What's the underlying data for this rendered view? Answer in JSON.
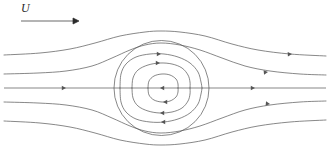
{
  "figure": {
    "background_color": "#ffffff",
    "stroke_color": "#555555",
    "label_color": "#2a2a2a",
    "width": 330,
    "height": 165
  },
  "annotations": {
    "freestream_label": "U",
    "freestream_arrow": {
      "name": "freestream-velocity-arrow",
      "x1": 21,
      "y1": 21,
      "x2": 79,
      "y2": 21,
      "direction": "right"
    }
  },
  "chart_data": {
    "type": "line",
    "subtitle": "Uniform stream U past a spherical vortex",
    "xlabel": "",
    "ylabel": "",
    "xlim": [
      0,
      330
    ],
    "ylim": [
      0,
      165
    ],
    "grid": false,
    "legend": "none",
    "symmetry_axis": {
      "name": "centerline",
      "y": 88,
      "x_start": 4,
      "x_end": 326
    },
    "vortex_boundary": {
      "name": "vortex-sphere-boundary",
      "shape": "circle",
      "cx": 161.5,
      "cy": 88,
      "r": 47.5
    },
    "series": [
      {
        "name": "outer-streamline-top",
        "kind": "external",
        "points": [
          [
            4,
            55
          ],
          [
            40,
            53
          ],
          [
            70,
            49
          ],
          [
            95,
            43
          ],
          [
            120,
            36
          ],
          [
            145,
            32
          ],
          [
            161,
            31
          ],
          [
            180,
            32
          ],
          [
            205,
            36
          ],
          [
            232,
            44
          ],
          [
            258,
            50
          ],
          [
            290,
            54
          ],
          [
            326,
            56
          ]
        ]
      },
      {
        "name": "streamline-top-inner",
        "kind": "external",
        "points": [
          [
            4,
            74
          ],
          [
            38,
            73
          ],
          [
            66,
            71
          ],
          [
            92,
            66
          ],
          [
            112,
            58
          ],
          [
            130,
            50
          ],
          [
            145,
            45
          ],
          [
            161,
            43
          ],
          [
            180,
            45
          ],
          [
            200,
            50
          ],
          [
            222,
            58
          ],
          [
            245,
            66
          ],
          [
            270,
            71
          ],
          [
            300,
            74
          ],
          [
            326,
            75
          ]
        ]
      },
      {
        "name": "streamline-bottom-inner",
        "kind": "external",
        "points": [
          [
            4,
            102
          ],
          [
            38,
            103
          ],
          [
            66,
            105
          ],
          [
            92,
            110
          ],
          [
            112,
            118
          ],
          [
            130,
            126
          ],
          [
            145,
            131
          ],
          [
            161,
            133
          ],
          [
            180,
            131
          ],
          [
            200,
            126
          ],
          [
            222,
            118
          ],
          [
            245,
            110
          ],
          [
            270,
            105
          ],
          [
            300,
            102
          ],
          [
            326,
            101
          ]
        ]
      },
      {
        "name": "outer-streamline-bottom",
        "kind": "external",
        "points": [
          [
            4,
            121
          ],
          [
            40,
            123
          ],
          [
            70,
            127
          ],
          [
            95,
            133
          ],
          [
            120,
            140
          ],
          [
            145,
            144
          ],
          [
            161,
            145
          ],
          [
            180,
            144
          ],
          [
            205,
            140
          ],
          [
            232,
            132
          ],
          [
            258,
            126
          ],
          [
            290,
            122
          ],
          [
            326,
            120
          ]
        ]
      },
      {
        "name": "inner-loop-top-outer",
        "kind": "closed-upper",
        "points": [
          [
            120,
            88
          ],
          [
            121,
            74
          ],
          [
            126,
            64
          ],
          [
            136,
            57
          ],
          [
            150,
            54
          ],
          [
            164,
            54
          ],
          [
            178,
            57
          ],
          [
            190,
            63
          ],
          [
            198,
            72
          ],
          [
            201,
            82
          ],
          [
            202,
            88
          ]
        ]
      },
      {
        "name": "inner-loop-top-middle",
        "kind": "closed-upper",
        "points": [
          [
            132,
            88
          ],
          [
            133,
            78
          ],
          [
            138,
            70
          ],
          [
            148,
            65
          ],
          [
            160,
            63
          ],
          [
            172,
            64
          ],
          [
            182,
            68
          ],
          [
            188,
            75
          ],
          [
            190,
            82
          ],
          [
            190,
            88
          ]
        ]
      },
      {
        "name": "inner-loop-top-inner",
        "kind": "closed-upper",
        "points": [
          [
            148,
            88
          ],
          [
            149,
            81
          ],
          [
            154,
            76
          ],
          [
            162,
            74
          ],
          [
            170,
            75
          ],
          [
            176,
            79
          ],
          [
            178,
            84
          ],
          [
            178,
            88
          ]
        ]
      },
      {
        "name": "inner-loop-bottom-outer",
        "kind": "closed-lower",
        "points": [
          [
            120,
            88
          ],
          [
            121,
            102
          ],
          [
            126,
            112
          ],
          [
            136,
            119
          ],
          [
            150,
            122
          ],
          [
            164,
            122
          ],
          [
            178,
            119
          ],
          [
            190,
            113
          ],
          [
            198,
            104
          ],
          [
            201,
            94
          ],
          [
            202,
            88
          ]
        ]
      },
      {
        "name": "inner-loop-bottom-middle",
        "kind": "closed-lower",
        "points": [
          [
            132,
            88
          ],
          [
            133,
            98
          ],
          [
            138,
            106
          ],
          [
            148,
            111
          ],
          [
            160,
            113
          ],
          [
            172,
            112
          ],
          [
            182,
            108
          ],
          [
            188,
            101
          ],
          [
            190,
            94
          ],
          [
            190,
            88
          ]
        ]
      },
      {
        "name": "inner-loop-bottom-inner",
        "kind": "closed-lower",
        "points": [
          [
            148,
            88
          ],
          [
            149,
            95
          ],
          [
            154,
            100
          ],
          [
            162,
            102
          ],
          [
            170,
            101
          ],
          [
            176,
            97
          ],
          [
            178,
            92
          ],
          [
            178,
            88
          ]
        ]
      }
    ],
    "direction_arrows": [
      {
        "name": "arrow-axis-upstream",
        "x": 66,
        "y": 88,
        "angle": 0,
        "on": "centerline"
      },
      {
        "name": "arrow-axis-downstream",
        "x": 255,
        "y": 88,
        "angle": 0,
        "on": "centerline"
      },
      {
        "name": "arrow-axis-interior",
        "x": 160,
        "y": 88,
        "angle": 180,
        "on": "centerline"
      },
      {
        "name": "arrow-streamline-top-right",
        "x": 268,
        "y": 72,
        "angle": -6,
        "on": "streamline-top-inner"
      },
      {
        "name": "arrow-streamline-bottom-right",
        "x": 270,
        "y": 104,
        "angle": 6,
        "on": "streamline-bottom-inner"
      },
      {
        "name": "arrow-outer-top-right",
        "x": 292,
        "y": 54,
        "angle": -3,
        "on": "outer-streamline-top"
      },
      {
        "name": "arrow-loop-top-outer",
        "x": 161,
        "y": 54,
        "angle": 0,
        "on": "inner-loop-top-outer"
      },
      {
        "name": "arrow-loop-top-middle",
        "x": 160,
        "y": 63,
        "angle": 0,
        "on": "inner-loop-top-middle"
      },
      {
        "name": "arrow-loop-bottom-outer",
        "x": 161,
        "y": 122,
        "angle": 180,
        "on": "inner-loop-bottom-outer"
      },
      {
        "name": "arrow-loop-bottom-middle",
        "x": 160,
        "y": 113,
        "angle": 180,
        "on": "inner-loop-bottom-middle"
      },
      {
        "name": "arrow-loop-bottom-inner",
        "x": 163,
        "y": 102,
        "angle": 180,
        "on": "inner-loop-bottom-inner"
      }
    ]
  }
}
